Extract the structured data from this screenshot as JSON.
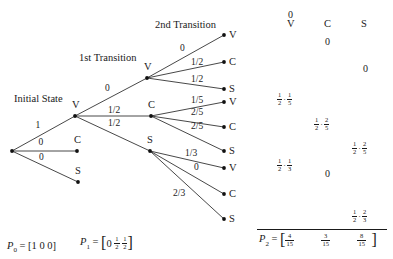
{
  "headings": {
    "initial": "Initial State",
    "first": "1st Transition",
    "second": "2nd Transition"
  },
  "tree": {
    "root": {
      "x": 12,
      "y": 151
    },
    "level1": [
      {
        "label": "V",
        "prob": "1",
        "x": 75,
        "y": 116
      },
      {
        "label": "C",
        "prob": "0",
        "x": 77,
        "y": 151
      },
      {
        "label": "S",
        "prob": "0",
        "x": 78,
        "y": 182
      }
    ],
    "level2": [
      {
        "label": "V",
        "prob": "0",
        "x": 147,
        "y": 78
      },
      {
        "label": "C",
        "prob": "1/2",
        "x": 151,
        "y": 116
      },
      {
        "label": "S",
        "prob": "1/2",
        "x": 150,
        "y": 151
      }
    ],
    "level3": [
      {
        "parent": 0,
        "label": "V",
        "prob": "0",
        "x": 224,
        "y": 35
      },
      {
        "parent": 0,
        "label": "C",
        "prob": "1/2",
        "x": 224,
        "y": 62
      },
      {
        "parent": 0,
        "label": "S",
        "prob": "1/2",
        "x": 224,
        "y": 89
      },
      {
        "parent": 1,
        "label": "V",
        "prob": "1/5",
        "x": 224,
        "y": 102
      },
      {
        "parent": 1,
        "label": "C",
        "prob": "2/5",
        "x": 224,
        "y": 127
      },
      {
        "parent": 1,
        "label": "S",
        "prob": "2/5",
        "x": 224,
        "y": 151
      },
      {
        "parent": 2,
        "label": "V",
        "prob": "1/3",
        "x": 224,
        "y": 168
      },
      {
        "parent": 2,
        "label": "C",
        "prob": "0",
        "x": 224,
        "y": 194
      },
      {
        "parent": 2,
        "label": "S",
        "prob": "2/3",
        "x": 224,
        "y": 219
      }
    ]
  },
  "table": {
    "columns": [
      "V",
      "C",
      "S"
    ],
    "rows": [
      {
        "col": 0,
        "value": "0"
      },
      {
        "col": 1,
        "value": "0"
      },
      {
        "col": 2,
        "value": "0"
      },
      {
        "col": 0,
        "value": "1/2 · 1/5"
      },
      {
        "col": 1,
        "value": "1/2 · 2/5"
      },
      {
        "col": 2,
        "value": "1/2 · 2/5"
      },
      {
        "col": 0,
        "value": "1/2 · 1/3"
      },
      {
        "col": 1,
        "value": "0"
      },
      {
        "col": 2,
        "value": "1/2 · 2/3"
      }
    ]
  },
  "vectors": {
    "p0": {
      "name": "P",
      "sub": "0",
      "value": "[1 0 0]"
    },
    "p1": {
      "name": "P",
      "sub": "1",
      "entries": [
        "0",
        "1/2",
        "1/2"
      ]
    },
    "p2": {
      "name": "P",
      "sub": "2",
      "entries": [
        "4/15",
        "3/15",
        "8/15"
      ]
    }
  }
}
